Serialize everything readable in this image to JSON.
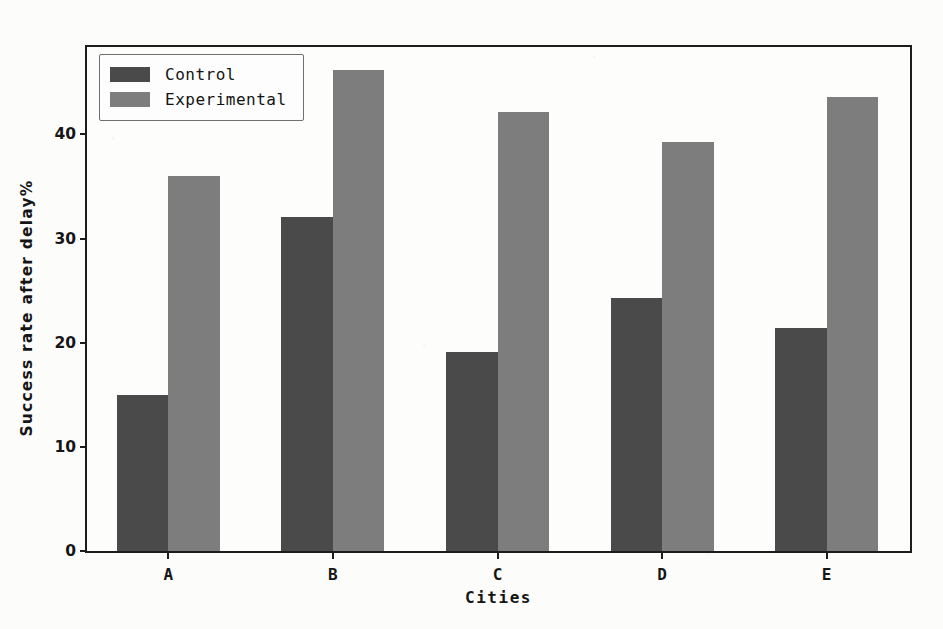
{
  "chart_data": {
    "type": "bar",
    "title": "",
    "xlabel": "Cities",
    "ylabel": "Success rate after delay%",
    "categories": [
      "A",
      "B",
      "C",
      "D",
      "E"
    ],
    "series": [
      {
        "name": "Control",
        "color": "#4a4a4a",
        "values": [
          15.0,
          32.1,
          19.1,
          24.3,
          21.4
        ]
      },
      {
        "name": "Experimental",
        "color": "#7d7d7d",
        "values": [
          36.0,
          46.2,
          42.2,
          39.3,
          43.6
        ]
      }
    ],
    "ylim": [
      0,
      48.4
    ],
    "yticks": [
      0,
      10,
      20,
      30,
      40
    ],
    "ytick_labels": [
      "0",
      "10",
      "20",
      "30",
      "40"
    ],
    "grid": false,
    "legend_position": "upper left"
  },
  "legend": {
    "entries": [
      {
        "label": "Control"
      },
      {
        "label": "Experimental"
      }
    ]
  }
}
